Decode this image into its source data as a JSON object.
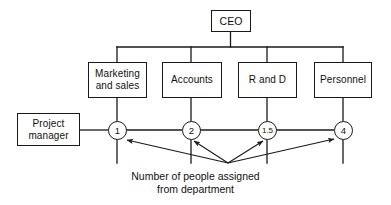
{
  "diagram": {
    "stroke_color": "#1a1a1a",
    "text_color": "#111111",
    "background_color": "#ffffff",
    "top_node": {
      "label": "CEO"
    },
    "project_node": {
      "label": "Project\nmanager"
    },
    "departments": [
      {
        "label": "Marketing\nand sales",
        "count": "1"
      },
      {
        "label": "Accounts",
        "count": "2"
      },
      {
        "label": "R and D",
        "count": "1.5"
      },
      {
        "label": "Personnel",
        "count": "4"
      }
    ],
    "caption": {
      "line1": "Number of people assigned",
      "line2": "from department"
    }
  }
}
